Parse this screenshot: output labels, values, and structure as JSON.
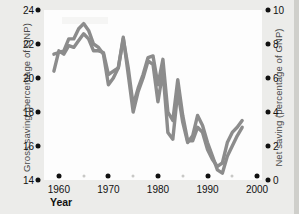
{
  "chart_data": {
    "type": "line",
    "title": "",
    "xlabel": "Year",
    "grid": false,
    "legend_position": "none",
    "x_ticks": [
      1960,
      1970,
      1980,
      1990,
      2000
    ],
    "x_minor_ticks": [
      1965,
      1975,
      1985,
      1995
    ],
    "xlim": [
      1957,
      2001
    ],
    "axes": [
      {
        "side": "left",
        "label": "Gross saving (percentage of GNP)",
        "ticks": [
          24,
          22,
          20,
          18,
          16,
          14
        ],
        "lim": [
          14,
          24
        ]
      },
      {
        "side": "right",
        "label": "Net saving (percentage of GNP)",
        "ticks": [
          10,
          8,
          6,
          4,
          2,
          0
        ],
        "lim": [
          0,
          10
        ]
      }
    ],
    "series": [
      {
        "name": "Gross saving",
        "axis": "left",
        "color": "#8c8c8c",
        "x": [
          1959,
          1960,
          1961,
          1962,
          1963,
          1964,
          1965,
          1966,
          1967,
          1968,
          1969,
          1970,
          1971,
          1972,
          1973,
          1974,
          1975,
          1976,
          1977,
          1978,
          1979,
          1980,
          1981,
          1982,
          1983,
          1984,
          1985,
          1986,
          1987,
          1988,
          1989,
          1990,
          1991,
          1992,
          1993,
          1994,
          1995,
          1996,
          1997
        ],
        "values": [
          20.4,
          21.6,
          21.4,
          21.9,
          21.8,
          22.2,
          22.6,
          22.3,
          21.6,
          21.6,
          21.5,
          20.2,
          20.4,
          20.6,
          22.3,
          20.6,
          18.4,
          19.4,
          20.2,
          21.2,
          21.3,
          19.6,
          21.1,
          18.0,
          17.5,
          19.9,
          17.8,
          16.3,
          16.3,
          17.1,
          16.8,
          15.8,
          15.2,
          14.8,
          15.0,
          16.2,
          16.8,
          17.1,
          17.5
        ]
      },
      {
        "name": "Net saving",
        "axis": "right",
        "color": "#8c8c8c",
        "x": [
          1959,
          1960,
          1961,
          1962,
          1963,
          1964,
          1965,
          1966,
          1967,
          1968,
          1969,
          1970,
          1971,
          1972,
          1973,
          1974,
          1975,
          1976,
          1977,
          1978,
          1979,
          1980,
          1981,
          1982,
          1983,
          1984,
          1985,
          1986,
          1987,
          1988,
          1989,
          1990,
          1991,
          1992,
          1993,
          1994,
          1995,
          1996,
          1997
        ],
        "values": [
          7.4,
          7.5,
          7.6,
          8.3,
          8.3,
          8.9,
          9.2,
          8.8,
          8.0,
          7.8,
          7.4,
          5.6,
          6.0,
          6.6,
          8.4,
          6.2,
          4.0,
          5.2,
          6.0,
          7.0,
          6.8,
          4.6,
          6.4,
          2.8,
          2.4,
          5.2,
          3.4,
          2.2,
          2.6,
          3.8,
          3.2,
          2.2,
          1.4,
          0.6,
          0.4,
          1.4,
          2.0,
          2.6,
          3.1
        ]
      }
    ],
    "annotations": []
  },
  "ticks": {
    "left": [
      "24",
      "22",
      "20",
      "18",
      "16",
      "14"
    ],
    "right": [
      "10",
      "8",
      "6",
      "4",
      "2",
      "0"
    ],
    "x": [
      "1960",
      "1970",
      "1980",
      "1990",
      "2000"
    ]
  },
  "labels": {
    "y_left": "Gross saving (percentage of GNP)",
    "y_right": "Net saving (percentage of GNP)",
    "x": "Year"
  },
  "colors": {
    "line": "#8c8c8c",
    "background": "#ececea",
    "plot_background": "#fdfdfd",
    "text": "#111111"
  }
}
